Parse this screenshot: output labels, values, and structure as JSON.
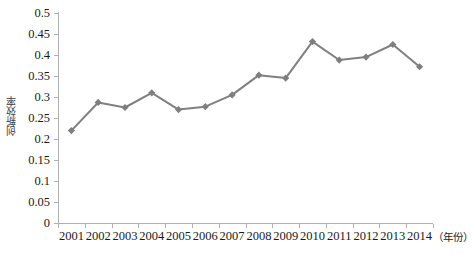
{
  "chart_data": {
    "type": "line",
    "title": "",
    "subtitle": "",
    "xlabel": "（年份）",
    "ylabel": "创新效率",
    "categories": [
      "2001",
      "2002",
      "2003",
      "2004",
      "2005",
      "2006",
      "2007",
      "2008",
      "2009",
      "2010",
      "2011",
      "2012",
      "2013",
      "2014"
    ],
    "values": [
      0.22,
      0.287,
      0.275,
      0.31,
      0.27,
      0.277,
      0.305,
      0.352,
      0.345,
      0.432,
      0.388,
      0.395,
      0.425,
      0.372
    ],
    "series": [
      {
        "name": "创新效率",
        "values": [
          0.22,
          0.287,
          0.275,
          0.31,
          0.27,
          0.277,
          0.305,
          0.352,
          0.345,
          0.432,
          0.388,
          0.395,
          0.425,
          0.372
        ]
      }
    ],
    "ylim": [
      0,
      0.5
    ],
    "y_ticks": [
      0,
      0.05,
      0.1,
      0.15,
      0.2,
      0.25,
      0.3,
      0.35,
      0.4,
      0.45,
      0.5
    ],
    "y_tick_labels": [
      "0",
      "0.05",
      "0.1",
      "0.15",
      "0.2",
      "0.25",
      "0.3",
      "0.35",
      "0.4",
      "0.45",
      "0.5"
    ],
    "grid": false,
    "legend": false,
    "legend_position": "none",
    "marker": "diamond",
    "line_color": "#808080",
    "marker_color": "#7f7f7f",
    "axis_color": "#b0b0b0",
    "background_color": "#ffffff"
  }
}
